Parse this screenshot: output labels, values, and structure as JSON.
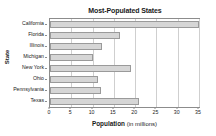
{
  "chart_data": {
    "type": "bar",
    "orientation": "horizontal",
    "title": "Most-Populated States",
    "xlabel": "Population",
    "xlabel_unit": "(in millions)",
    "ylabel": "State",
    "categories": [
      "California",
      "Florida",
      "Illinois",
      "Michigan",
      "New York",
      "Ohio",
      "Pennsylvania",
      "Texas"
    ],
    "values": [
      35,
      16.5,
      12.2,
      10,
      19,
      11.3,
      12,
      21
    ],
    "xlim": [
      0,
      35
    ],
    "xticks": [
      0,
      5,
      10,
      15,
      20,
      25,
      30,
      35
    ],
    "xtick_labels": [
      "0",
      "5",
      "10",
      "15",
      "20",
      "25",
      "30",
      "35"
    ],
    "grid": "vertical",
    "legend": "none",
    "bar_fill_color": "#d6d6d6",
    "bar_border_color": "#9a9a9a",
    "grid_color": "#cfcfcf",
    "axis_color": "#8c8c8c",
    "text_color": "#1a1a1a",
    "background_color": "#ffffff"
  }
}
